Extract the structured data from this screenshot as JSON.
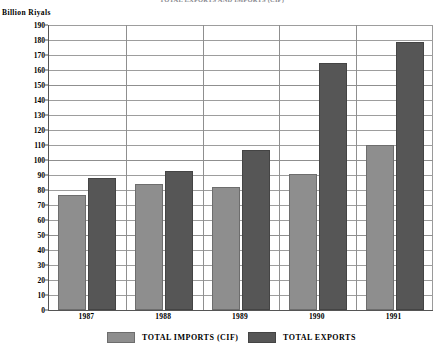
{
  "chart_data": {
    "type": "bar",
    "title": "TOTAL EXPORTS AND IMPORTS (CIF)",
    "ylabel": "Billion Riyals",
    "xlabel": "",
    "categories": [
      "1987",
      "1988",
      "1989",
      "1990",
      "1991"
    ],
    "series": [
      {
        "name": "TOTAL IMPORTS (CIF)",
        "color": "#8e8e8e",
        "values": [
          77,
          84,
          82,
          91,
          110
        ]
      },
      {
        "name": "TOTAL EXPORTS",
        "color": "#565656",
        "values": [
          88,
          93,
          107,
          165,
          179
        ]
      }
    ],
    "ylim": [
      0,
      190
    ],
    "ytick_step": 10,
    "yticks": [
      0,
      10,
      20,
      30,
      40,
      50,
      60,
      70,
      80,
      90,
      100,
      110,
      120,
      130,
      140,
      150,
      160,
      170,
      180,
      190
    ],
    "grid": true,
    "legend_position": "bottom"
  }
}
